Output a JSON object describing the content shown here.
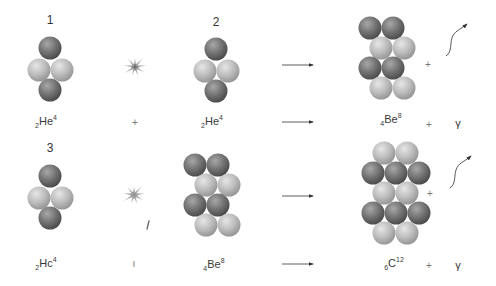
{
  "colors": {
    "dark_nucleon": "#6f6f6f",
    "light_nucleon": "#bdbdbd",
    "arrow": "#333333",
    "star": "#9a9a9a"
  },
  "rows": [
    {
      "step_number": "1",
      "step_number_2": "2",
      "reactants": [
        {
          "name": "helium-4",
          "prefix": "2",
          "symbol": "He",
          "mass": "4"
        },
        {
          "name": "helium-4",
          "prefix": "2",
          "symbol": "He",
          "mass": "4"
        }
      ],
      "plus_between": "+",
      "product": {
        "name": "beryllium-8",
        "prefix": "4",
        "symbol": "Be",
        "mass": "8"
      },
      "plus_after": "+",
      "emission": "γ",
      "diagram_plus": "+"
    },
    {
      "step_number": "3",
      "reactants": [
        {
          "name": "helium-4",
          "prefix": "2",
          "symbol": "Hc",
          "mass": "4"
        },
        {
          "name": "beryllium-8",
          "prefix": "4",
          "symbol": "Be",
          "mass": "8"
        }
      ],
      "plus_between": "ı",
      "product": {
        "name": "carbon-12",
        "prefix": "6",
        "symbol": "C",
        "mass": "12"
      },
      "plus_after": "+",
      "emission": "γ",
      "diagram_plus": "+"
    }
  ],
  "nuclei": {
    "he4_pattern": [
      "dark",
      "light",
      "light",
      "dark"
    ],
    "be8_pattern": [
      "dark",
      "dark",
      "light",
      "light",
      "dark",
      "dark",
      "light",
      "light"
    ],
    "c12_pattern": [
      "light",
      "light",
      "dark",
      "dark",
      "dark",
      "light",
      "light",
      "dark",
      "dark",
      "dark",
      "light",
      "light"
    ]
  }
}
